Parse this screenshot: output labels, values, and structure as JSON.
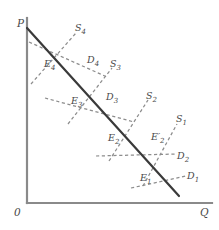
{
  "figure": {
    "type": "economics-supply-demand-diagram",
    "background_color": "#ffffff",
    "axis_color": "#8a8a8a",
    "market_line_color": "#3a3a3a",
    "curve_color": "#8d8d8d"
  },
  "axes": {
    "y_label": "P",
    "x_label": "Q",
    "origin_label": "0",
    "x_axis": {
      "x1": 27,
      "y1": 203,
      "x2": 212,
      "y2": 203
    },
    "y_axis": {
      "x1": 27,
      "y1": 18,
      "x2": 27,
      "y2": 203
    }
  },
  "market_line": {
    "name": "long-run-market-line",
    "x1": 27,
    "y1": 28,
    "x2": 179,
    "y2": 196
  },
  "supply_curves": [
    {
      "id": "S1",
      "label": "S",
      "subscript": "1",
      "label_x": 176,
      "label_y": 114,
      "x1": 143,
      "y1": 186,
      "x2": 177,
      "y2": 124
    },
    {
      "id": "S2",
      "label": "S",
      "subscript": "2",
      "label_x": 146,
      "label_y": 91,
      "x1": 109,
      "y1": 161,
      "x2": 148,
      "y2": 100
    },
    {
      "id": "S3",
      "label": "S",
      "subscript": "3",
      "label_x": 110,
      "label_y": 59,
      "x1": 68,
      "y1": 124,
      "x2": 112,
      "y2": 68
    },
    {
      "id": "S4",
      "label": "S",
      "subscript": "4",
      "label_x": 75,
      "label_y": 23,
      "x1": 31,
      "y1": 84,
      "x2": 76,
      "y2": 33
    }
  ],
  "demand_curves": [
    {
      "id": "D1",
      "label": "D",
      "subscript": "1",
      "label_x": 187,
      "label_y": 171,
      "x1": 131,
      "y1": 188,
      "x2": 186,
      "y2": 176
    },
    {
      "id": "D2",
      "label": "D",
      "subscript": "2",
      "label_x": 177,
      "label_y": 151,
      "x1": 96,
      "y1": 156,
      "x2": 176,
      "y2": 154
    },
    {
      "id": "D3",
      "label": "D",
      "subscript": "3",
      "label_x": 106,
      "label_y": 92,
      "x1": 45,
      "y1": 98,
      "x2": 134,
      "y2": 122
    },
    {
      "id": "D4",
      "label": "D",
      "subscript": "4",
      "label_x": 87,
      "label_y": 55,
      "x1": 29,
      "y1": 42,
      "x2": 107,
      "y2": 77
    }
  ],
  "equilibrium_points": [
    {
      "id": "E1",
      "label": "E",
      "subscript": "1",
      "prime": false,
      "label_x": 140,
      "label_y": 173,
      "x": 152,
      "y": 170
    },
    {
      "id": "E2",
      "label": "E",
      "subscript": "2",
      "prime": false,
      "label_x": 108,
      "label_y": 133,
      "x": 118,
      "y": 130
    },
    {
      "id": "E2prime",
      "label": "E",
      "subscript": "2",
      "prime": true,
      "label_x": 151,
      "label_y": 132,
      "x": 156,
      "y": 138
    },
    {
      "id": "E3",
      "label": "E",
      "subscript": "3",
      "prime": false,
      "label_x": 71,
      "label_y": 96,
      "x": 78,
      "y": 92
    },
    {
      "id": "E4",
      "label": "E",
      "subscript": "4",
      "prime": false,
      "label_x": 44,
      "label_y": 59,
      "x": 54,
      "y": 53
    }
  ]
}
